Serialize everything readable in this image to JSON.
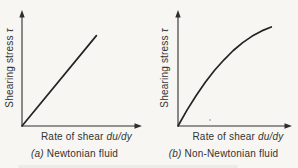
{
  "figure": {
    "background": "#f7f6f2",
    "ink": "#2e2e2e"
  },
  "panels": [
    {
      "y_label": "Shearing stress",
      "y_symbol": "τ",
      "x_label": "Rate of shear",
      "x_symbol": "du/dy",
      "caption_index": "(a)",
      "caption_label": "Newtonian fluid"
    },
    {
      "y_label": "Shearing stress",
      "y_symbol": "τ",
      "x_label": "Rate of shear",
      "x_symbol": "du/dy",
      "caption_index": "(b)",
      "caption_label": "Non-Newtonian fluid"
    }
  ],
  "chart_data": [
    {
      "type": "line",
      "title": "(a) Newtonian fluid",
      "xlabel": "Rate of shear du/dy",
      "ylabel": "Shearing stress τ",
      "x": [
        0,
        0.62
      ],
      "y": [
        0,
        0.8
      ],
      "xlim": [
        0,
        1
      ],
      "ylim": [
        0,
        1
      ],
      "grid": false,
      "legend": false,
      "note": "qualitative sketch, no numeric ticks; straight line through origin (constant slope = viscosity)"
    },
    {
      "type": "line",
      "title": "(b) Non-Newtonian fluid",
      "xlabel": "Rate of shear du/dy",
      "ylabel": "Shearing stress τ",
      "x": [
        0,
        0.08,
        0.161,
        0.242,
        0.324,
        0.407,
        0.489,
        0.573,
        0.657,
        0.741,
        0.826
      ],
      "y": [
        0,
        0.141,
        0.27,
        0.387,
        0.493,
        0.586,
        0.668,
        0.738,
        0.796,
        0.842,
        0.876
      ],
      "xlim": [
        0,
        1
      ],
      "ylim": [
        0,
        1
      ],
      "grid": false,
      "legend": false,
      "note": "qualitative sketch, no numeric ticks; concave-down curve through origin (slope decreases with rate of shear)"
    }
  ]
}
